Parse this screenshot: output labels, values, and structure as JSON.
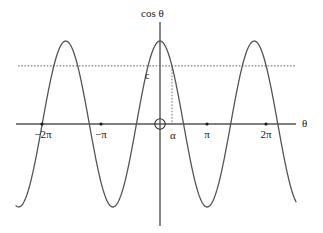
{
  "figure": {
    "title": "",
    "background_color": "#ffffff",
    "curve_color": "#555555",
    "axis_color": "#555555",
    "dotted_color": "#666666",
    "text_color": "#1a1a1a"
  },
  "axes": {
    "y_axis_label": "cos θ",
    "x_axis_label": "θ",
    "origin_marker": "origin-circle"
  },
  "x_ticks": [
    {
      "label": "−2π",
      "value": -6.283185,
      "px": 42
    },
    {
      "label": "−π",
      "value": -3.141593,
      "px": 101
    },
    {
      "label": "α",
      "value": 0.8,
      "px": 173
    },
    {
      "label": "π",
      "value": 3.141593,
      "px": 207
    },
    {
      "label": "2π",
      "value": 6.283185,
      "px": 266
    }
  ],
  "annotations": [
    {
      "name": "level-c",
      "label": "c",
      "kind": "horizontal-dotted-line",
      "y_value": 0.7
    },
    {
      "name": "alpha-drop",
      "label": "",
      "kind": "vertical-dotted-line",
      "x_value": 0.8
    }
  ],
  "chart_data": {
    "type": "line",
    "title": "",
    "xlabel": "θ",
    "ylabel": "cos θ",
    "function": "y = cos(θ)",
    "xlim": [
      -7.55,
      7.2
    ],
    "ylim": [
      -1.08,
      1.08
    ],
    "grid": false,
    "legend": null,
    "series": [
      {
        "name": "cos θ",
        "x": [
          -7.55,
          -7.0,
          -6.5,
          -6.283185,
          -6.0,
          -5.5,
          -5.0,
          -4.712389,
          -4.5,
          -4.0,
          -3.5,
          -3.141593,
          -3.0,
          -2.5,
          -2.0,
          -1.570796,
          -1.0,
          -0.5,
          0.0,
          0.5,
          0.8,
          1.0,
          1.570796,
          2.0,
          2.5,
          3.0,
          3.141593,
          3.5,
          4.0,
          4.5,
          4.712389,
          5.0,
          5.5,
          6.0,
          6.283185,
          6.5,
          7.0,
          7.2
        ],
        "y": [
          0.26,
          0.75,
          0.98,
          1.0,
          0.96,
          0.71,
          0.28,
          0.0,
          -0.21,
          -0.65,
          -0.94,
          -1.0,
          -0.99,
          -0.8,
          -0.42,
          0.0,
          0.54,
          0.88,
          1.0,
          0.88,
          0.7,
          0.54,
          0.0,
          -0.42,
          -0.8,
          -0.99,
          -1.0,
          -0.94,
          -0.65,
          -0.21,
          0.0,
          0.28,
          0.71,
          0.96,
          1.0,
          0.98,
          0.75,
          0.58
        ]
      }
    ],
    "reference_lines": [
      {
        "name": "c",
        "orientation": "horizontal",
        "value": 0.7,
        "style": "dotted",
        "label": "c"
      },
      {
        "name": "alpha",
        "orientation": "vertical",
        "value": 0.8,
        "style": "dotted",
        "label": "α",
        "from": 0,
        "to": 0.7
      }
    ],
    "marked_points": [
      {
        "label": "−2π",
        "x": -6.283185,
        "y": 0
      },
      {
        "label": "−π",
        "x": -3.141593,
        "y": 0
      },
      {
        "label": "π",
        "x": 3.141593,
        "y": 0
      },
      {
        "label": "2π",
        "x": 6.283185,
        "y": 0
      }
    ],
    "x_tick_labels": [
      "−2π",
      "−π",
      "α",
      "π",
      "2π"
    ],
    "y_tick_labels": [
      "c"
    ]
  }
}
